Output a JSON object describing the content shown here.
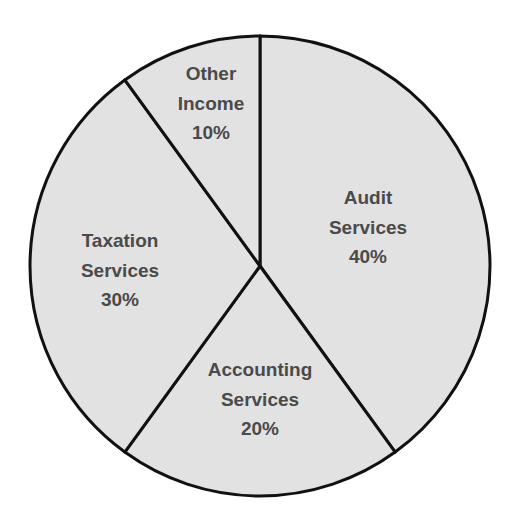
{
  "chart_data": {
    "type": "pie",
    "title": "",
    "start_angle_deg": 0,
    "direction": "clockwise",
    "slices": [
      {
        "name": "Audit Services",
        "lines": [
          "Audit",
          "Services",
          "40%"
        ],
        "value": 40,
        "label_pos": [
          368,
          197
        ]
      },
      {
        "name": "Accounting Services",
        "lines": [
          "Accounting",
          "Services",
          "20%"
        ],
        "value": 20,
        "label_pos": [
          260,
          369
        ]
      },
      {
        "name": "Taxation Services",
        "lines": [
          "Taxation",
          "Services",
          "30%"
        ],
        "value": 30,
        "label_pos": [
          120,
          240
        ]
      },
      {
        "name": "Other Income",
        "lines": [
          "Other",
          "Income",
          "10%"
        ],
        "value": 10,
        "label_pos": [
          211,
          73
        ]
      }
    ],
    "categories": [
      "Audit Services",
      "Accounting Services",
      "Taxation Services",
      "Other Income"
    ],
    "values": [
      40,
      20,
      30,
      10
    ],
    "unit": "%",
    "legend": "none (labels inside slices)"
  },
  "style": {
    "fill_color": "#e2e2e2",
    "stroke_color": "#111111",
    "text_color": "#4a4a4a",
    "background": "#ffffff"
  },
  "geometry": {
    "cx": 260,
    "cy": 266,
    "r": 230,
    "line_height": 29.5
  }
}
